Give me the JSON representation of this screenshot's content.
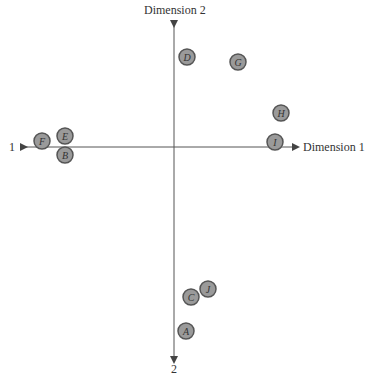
{
  "chart_data": {
    "type": "scatter",
    "title": "",
    "xlabel": "Dimension 1",
    "ylabel": "Dimension 2",
    "x_neg_label": "1",
    "y_neg_label": "2",
    "grid": false,
    "points": [
      {
        "label": "A",
        "x": 12,
        "y": -184
      },
      {
        "label": "B",
        "x": -109,
        "y": -8
      },
      {
        "label": "C",
        "x": 17,
        "y": -150
      },
      {
        "label": "D",
        "x": 13,
        "y": 90
      },
      {
        "label": "E",
        "x": -109,
        "y": 11
      },
      {
        "label": "F",
        "x": -132,
        "y": 6
      },
      {
        "label": "G",
        "x": 64,
        "y": 85
      },
      {
        "label": "H",
        "x": 107,
        "y": 34
      },
      {
        "label": "I",
        "x": 101,
        "y": 5
      },
      {
        "label": "J",
        "x": 34,
        "y": -142
      }
    ]
  },
  "colors": {
    "axis": "#444444",
    "marker_fill": "#9a9a9a",
    "marker_stroke": "#555555",
    "marker_text": "#333333"
  }
}
